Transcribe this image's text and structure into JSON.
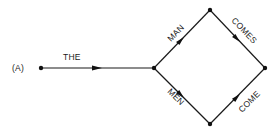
{
  "figure": {
    "label": "(A)",
    "colors": {
      "stroke": "#1a1a1a",
      "background": "#ffffff"
    }
  },
  "nodes": [
    {
      "id": "start",
      "x": 41,
      "y": 68
    },
    {
      "id": "branch",
      "x": 154,
      "y": 68
    },
    {
      "id": "top",
      "x": 210,
      "y": 10
    },
    {
      "id": "end",
      "x": 265,
      "y": 68
    },
    {
      "id": "bottom",
      "x": 210,
      "y": 124
    }
  ],
  "edges": [
    {
      "from": "start",
      "to": "branch",
      "label": "THE"
    },
    {
      "from": "branch",
      "to": "top",
      "label": "MAN"
    },
    {
      "from": "top",
      "to": "end",
      "label": "COMES"
    },
    {
      "from": "branch",
      "to": "bottom",
      "label": "MEN"
    },
    {
      "from": "bottom",
      "to": "end",
      "label": "COME"
    }
  ]
}
